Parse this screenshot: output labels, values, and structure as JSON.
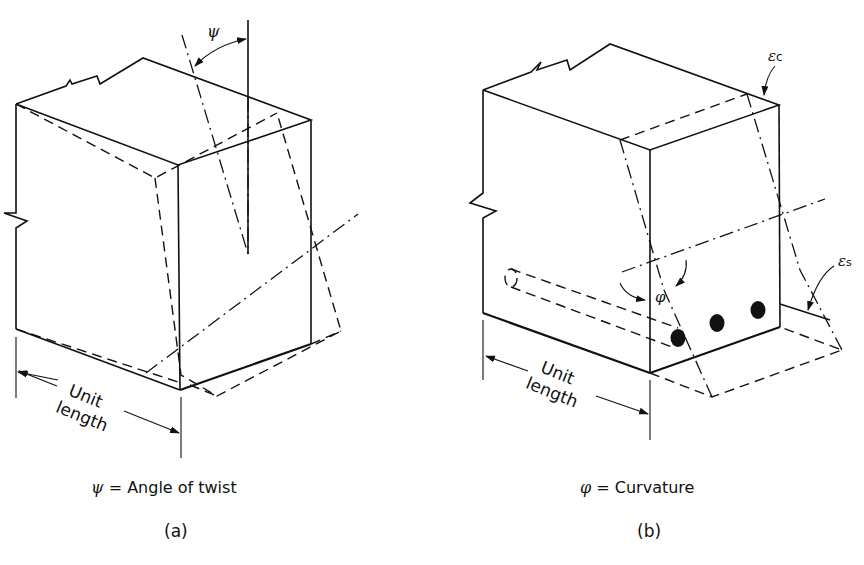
{
  "figure": {
    "panel_a": {
      "sublabel": "(a)",
      "caption_symbol": "ψ",
      "caption_text": "= Angle of twist",
      "angle_label": "ψ",
      "dimension_line1": "Unit",
      "dimension_line2": "length"
    },
    "panel_b": {
      "sublabel": "(b)",
      "caption_symbol": "φ",
      "caption_text": "= Curvature",
      "curvature_label": "φ",
      "concrete_strain_label": "εc",
      "steel_strain_label": "εs",
      "dimension_line1": "Unit",
      "dimension_line2": "length",
      "rebar_count": 3
    }
  }
}
